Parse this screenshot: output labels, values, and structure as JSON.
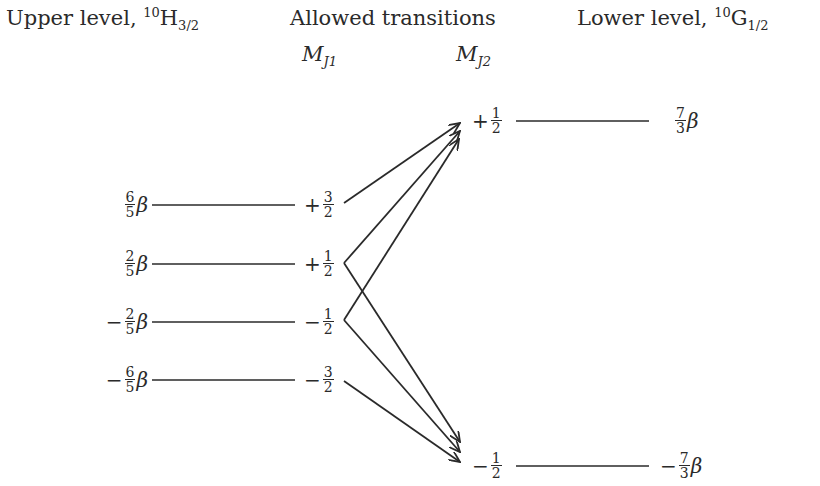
{
  "headers": {
    "upper": {
      "text": "Upper level, ",
      "sup": "10",
      "symbol": "H",
      "sub": "3/2"
    },
    "middle": {
      "text": "Allowed transitions"
    },
    "lower": {
      "text": "Lower level, ",
      "sup": "10",
      "symbol": "G",
      "sub": "1/2"
    }
  },
  "columns": {
    "mj1": {
      "symbol": "M",
      "sub": "J1"
    },
    "mj2": {
      "symbol": "M",
      "sub": "J2"
    }
  },
  "upper_levels": [
    {
      "energy_sign": "",
      "energy_num": "6",
      "energy_den": "5",
      "energy_unit": "β",
      "mj_sign": "+",
      "mj_num": "3",
      "mj_den": "2"
    },
    {
      "energy_sign": "",
      "energy_num": "2",
      "energy_den": "5",
      "energy_unit": "β",
      "mj_sign": "+",
      "mj_num": "1",
      "mj_den": "2"
    },
    {
      "energy_sign": "−",
      "energy_num": "2",
      "energy_den": "5",
      "energy_unit": "β",
      "mj_sign": "−",
      "mj_num": "1",
      "mj_den": "2"
    },
    {
      "energy_sign": "−",
      "energy_num": "6",
      "energy_den": "5",
      "energy_unit": "β",
      "mj_sign": "−",
      "mj_num": "3",
      "mj_den": "2"
    }
  ],
  "lower_levels": [
    {
      "mj_sign": "+",
      "mj_num": "1",
      "mj_den": "2",
      "energy_sign": "",
      "energy_num": "7",
      "energy_den": "3",
      "energy_unit": "β"
    },
    {
      "mj_sign": "−",
      "mj_num": "1",
      "mj_den": "2",
      "energy_sign": "−",
      "energy_num": "7",
      "energy_den": "3",
      "energy_unit": "β"
    }
  ],
  "transitions": [
    {
      "from": "+3/2",
      "to": "+1/2"
    },
    {
      "from": "+1/2",
      "to": "+1/2"
    },
    {
      "from": "+1/2",
      "to": "−1/2"
    },
    {
      "from": "−1/2",
      "to": "+1/2"
    },
    {
      "from": "−1/2",
      "to": "−1/2"
    },
    {
      "from": "−3/2",
      "to": "−1/2"
    }
  ],
  "colors": {
    "ink": "#2a2a2a",
    "background": "#ffffff"
  }
}
